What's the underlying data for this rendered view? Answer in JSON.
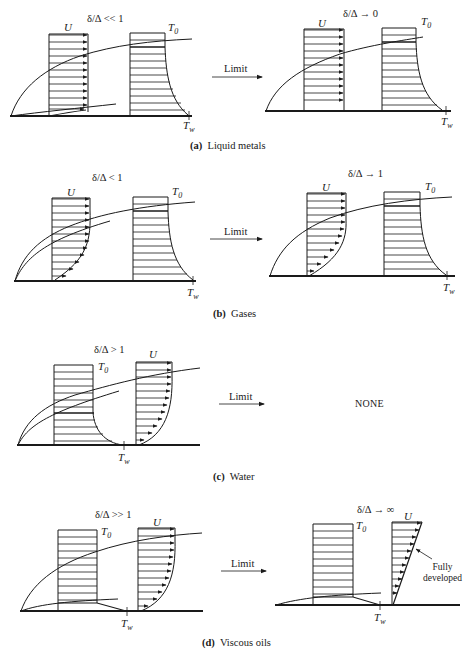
{
  "figure": {
    "panels": [
      {
        "id": "a",
        "caption_letter": "(a)",
        "caption_text": "Liquid metals",
        "left": {
          "ratio": "δ/Δ << 1",
          "u_label": "U",
          "t0_label": "T",
          "t0_sub": "0",
          "tw_label": "T",
          "tw_sub": "w"
        },
        "right": {
          "ratio": "δ/Δ → 0",
          "u_label": "U",
          "t0_label": "T",
          "t0_sub": "0",
          "tw_label": "T",
          "tw_sub": "w"
        },
        "arrow_label": "Limit"
      },
      {
        "id": "b",
        "caption_letter": "(b)",
        "caption_text": "Gases",
        "left": {
          "ratio": "δ/Δ < 1",
          "u_label": "U",
          "t0_label": "T",
          "t0_sub": "0",
          "tw_label": "T",
          "tw_sub": "w"
        },
        "right": {
          "ratio": "δ/Δ → 1",
          "u_label": "U",
          "t0_label": "T",
          "t0_sub": "0",
          "tw_label": "T",
          "tw_sub": "w"
        },
        "arrow_label": "Limit"
      },
      {
        "id": "c",
        "caption_letter": "(c)",
        "caption_text": "Water",
        "left": {
          "ratio": "δ/Δ > 1",
          "u_label": "U",
          "t0_label": "T",
          "t0_sub": "0",
          "tw_label": "T",
          "tw_sub": "w"
        },
        "right_text": "NONE",
        "arrow_label": "Limit"
      },
      {
        "id": "d",
        "caption_letter": "(d)",
        "caption_text": "Viscous oils",
        "left": {
          "ratio": "δ/Δ >> 1",
          "u_label": "U",
          "t0_label": "T",
          "t0_sub": "0",
          "tw_label": "T",
          "tw_sub": "w"
        },
        "right": {
          "ratio": "δ/Δ → ∞",
          "u_label": "U",
          "t0_label": "T",
          "t0_sub": "0",
          "tw_label": "T",
          "tw_sub": "w",
          "annotation_line1": "Fully",
          "annotation_line2": "developed"
        },
        "arrow_label": "Limit"
      }
    ],
    "ink_color": "#1a1a1a"
  }
}
